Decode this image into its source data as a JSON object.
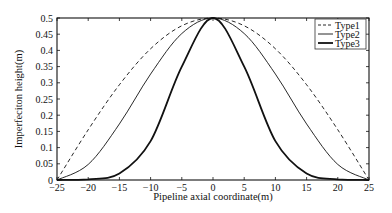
{
  "chart_data": {
    "type": "line",
    "title": "",
    "xlabel": "Pipeline axial coordinate(m)",
    "ylabel": "Imperfeciton height(m)",
    "xlim": [
      -25,
      25
    ],
    "ylim": [
      0,
      0.5
    ],
    "xticks": [
      -25,
      -20,
      -15,
      -10,
      -5,
      0,
      5,
      10,
      15,
      20,
      25
    ],
    "yticks": [
      0,
      0.05,
      0.1,
      0.15,
      0.2,
      0.25,
      0.3,
      0.35,
      0.4,
      0.45,
      0.5
    ],
    "ytick_labels": [
      "0",
      "0.05",
      "0.1",
      "0.15",
      "0.2",
      "0.25",
      "0.3",
      "0.35",
      "0.4",
      "0.45",
      "0.5"
    ],
    "grid": false,
    "legend_position": "upper right",
    "x": [
      -25,
      -20,
      -15,
      -10,
      -5,
      0,
      5,
      10,
      15,
      20,
      25
    ],
    "series": [
      {
        "name": "Type1",
        "style": "dashed",
        "width": 0.9,
        "values": [
          0.0,
          0.155,
          0.294,
          0.405,
          0.476,
          0.5,
          0.476,
          0.405,
          0.294,
          0.155,
          0.0
        ]
      },
      {
        "name": "Type2",
        "style": "solid",
        "width": 0.9,
        "values": [
          0.0,
          0.048,
          0.173,
          0.327,
          0.452,
          0.5,
          0.452,
          0.327,
          0.173,
          0.048,
          0.0
        ]
      },
      {
        "name": "Type3",
        "style": "solid",
        "width": 1.8,
        "values": [
          0.0,
          0.002,
          0.02,
          0.12,
          0.35,
          0.5,
          0.35,
          0.12,
          0.02,
          0.002,
          0.0
        ]
      }
    ]
  }
}
